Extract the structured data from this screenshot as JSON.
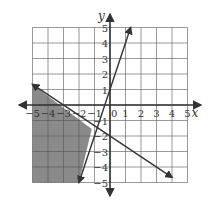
{
  "chart_data": {
    "type": "line",
    "title": "",
    "xlabel": "x",
    "ylabel": "y",
    "xlim": [
      -5,
      5
    ],
    "ylim": [
      -5,
      5
    ],
    "grid": true,
    "x_ticks": [
      "-5",
      "-4",
      "-3",
      "-2",
      "-1",
      "0",
      "1",
      "2",
      "3",
      "4",
      "5"
    ],
    "y_ticks": [
      "-5",
      "-4",
      "-3",
      "-2",
      "-1",
      "1",
      "2",
      "3",
      "4",
      "5"
    ],
    "series": [
      {
        "name": "line-1",
        "equation": "y = 3x + 1",
        "x": [
          -2,
          1.33
        ],
        "y": [
          -5,
          5
        ]
      },
      {
        "name": "line-2",
        "equation": "y = -2/3 x - 2",
        "x": [
          -5,
          4
        ],
        "y": [
          1.33,
          -4.67
        ]
      }
    ],
    "shaded_region": {
      "description": "below y = -2/3x - 2 and left of y = 3x + 1",
      "vertices": [
        [
          -5,
          1.33
        ],
        [
          -1.18,
          -1.55
        ],
        [
          -2,
          -5
        ],
        [
          -5,
          -5
        ]
      ],
      "color": "#8a8a8a"
    }
  },
  "labels": {
    "x_axis": "x",
    "y_axis": "y",
    "x_ticks": [
      {
        "v": -5,
        "t": "-5"
      },
      {
        "v": -4,
        "t": "-4"
      },
      {
        "v": -3,
        "t": "-3"
      },
      {
        "v": -2,
        "t": "-2"
      },
      {
        "v": -1,
        "t": "-1"
      },
      {
        "v": 1,
        "t": "1"
      },
      {
        "v": 2,
        "t": "2"
      },
      {
        "v": 3,
        "t": "3"
      },
      {
        "v": 4,
        "t": "4"
      },
      {
        "v": 5,
        "t": "5"
      }
    ],
    "origin": "0",
    "y_ticks": [
      {
        "v": 5,
        "t": "5"
      },
      {
        "v": 4,
        "t": "4"
      },
      {
        "v": 3,
        "t": "3"
      },
      {
        "v": 2,
        "t": "2"
      },
      {
        "v": 1,
        "t": "1"
      },
      {
        "v": -1,
        "t": "-1"
      },
      {
        "v": -2,
        "t": "-2"
      },
      {
        "v": -3,
        "t": "-3"
      },
      {
        "v": -4,
        "t": "-4"
      },
      {
        "v": -5,
        "t": "-5"
      }
    ]
  }
}
